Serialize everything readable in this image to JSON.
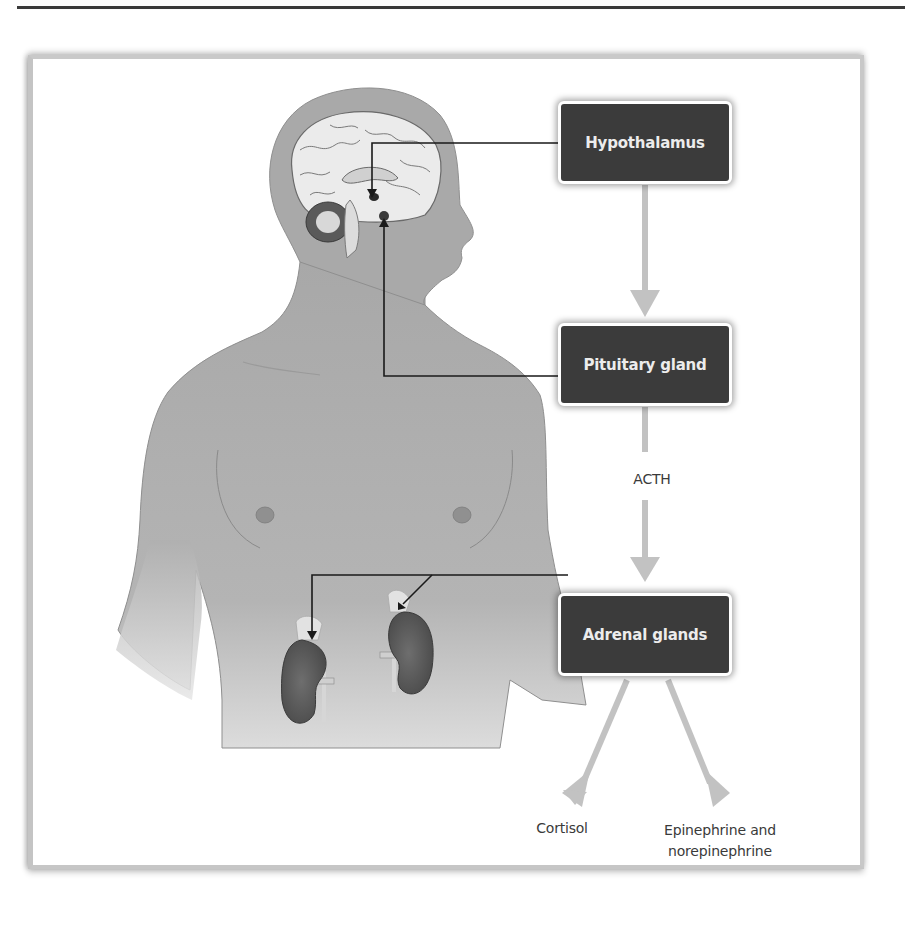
{
  "diagram": {
    "nodes": [
      {
        "id": "hypothalamus",
        "label": "Hypothalamus"
      },
      {
        "id": "pituitary",
        "label": "Pituitary gland"
      },
      {
        "id": "adrenal",
        "label": "Adrenal glands"
      }
    ],
    "edges": [
      {
        "from": "hypothalamus",
        "to": "pituitary",
        "label": ""
      },
      {
        "from": "pituitary",
        "to": "adrenal",
        "label": "ACTH"
      },
      {
        "from": "adrenal",
        "to": "cortisol",
        "label": ""
      },
      {
        "from": "adrenal",
        "to": "epinephrine",
        "label": ""
      }
    ],
    "outputs": {
      "cortisol": "Cortisol",
      "epinephrine_line1": "Epinephrine and",
      "epinephrine_line2": "norepinephrine"
    },
    "hormone_label": "ACTH",
    "colors": {
      "box_fill": "#3b3b3b",
      "box_text": "#ececec",
      "arrow": "#c2c2c2",
      "body": "#a9a9a9",
      "kidney": "#5e5e5e",
      "leader_line": "#1a1a1a"
    },
    "illustration": {
      "subject": "human torso with brain and kidneys",
      "leaders": [
        "brain-to-hypothalamus",
        "pituitary-to-pituitary-box",
        "adrenal-box-to-kidneys"
      ]
    }
  }
}
